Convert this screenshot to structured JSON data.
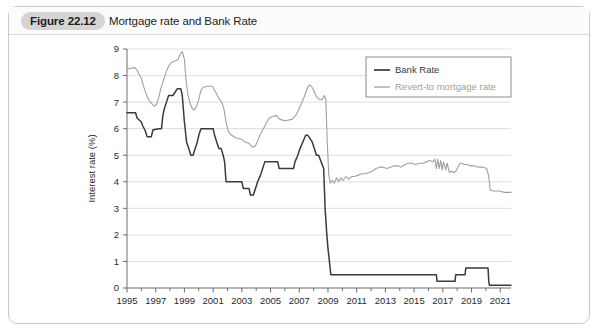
{
  "figure": {
    "badge": "Figure 22.12",
    "title": "Mortgage rate and Bank Rate"
  },
  "colors": {
    "bank_rate": "#3a3a3a",
    "revert_rate": "#a0a0a0",
    "grid": "#dedede",
    "axis": "#6d6d6d",
    "frame": "#c9c9c9",
    "badge_bg": "#d4d4d4",
    "text": "#2a2a2a"
  },
  "chart_data": {
    "type": "line",
    "title": "Mortgage rate and Bank Rate",
    "xlabel": "",
    "ylabel": "Interest rate (%)",
    "xlim": [
      1995,
      2021.75
    ],
    "ylim": [
      0,
      9
    ],
    "yticks": [
      0,
      1,
      2,
      3,
      4,
      5,
      6,
      7,
      8,
      9
    ],
    "xticks": [
      1995,
      1997,
      1999,
      2001,
      2003,
      2005,
      2007,
      2009,
      2011,
      2013,
      2015,
      2017,
      2019,
      2021
    ],
    "xtick_labels": [
      "1995",
      "1997",
      "1999",
      "2001",
      "2003",
      "2005",
      "2007",
      "2009",
      "2011",
      "2013",
      "2015",
      "2017",
      "2019",
      "2021"
    ],
    "ytick_labels": [
      "0",
      "1",
      "2",
      "3",
      "4",
      "5",
      "6",
      "7",
      "8",
      "9"
    ],
    "minor_xticks_every": 1,
    "grid": "horizontal",
    "legend_position": "top-right",
    "series": [
      {
        "name": "Bank Rate",
        "color": "#3a3a3a",
        "points": [
          [
            1995.0,
            6.6
          ],
          [
            1995.6,
            6.6
          ],
          [
            1995.7,
            6.4
          ],
          [
            1996.0,
            6.25
          ],
          [
            1996.1,
            6.1
          ],
          [
            1996.25,
            5.95
          ],
          [
            1996.4,
            5.7
          ],
          [
            1996.7,
            5.7
          ],
          [
            1996.8,
            5.95
          ],
          [
            1997.2,
            6.0
          ],
          [
            1997.4,
            6.0
          ],
          [
            1997.5,
            6.5
          ],
          [
            1997.6,
            6.75
          ],
          [
            1997.75,
            7.0
          ],
          [
            1997.9,
            7.25
          ],
          [
            1998.2,
            7.25
          ],
          [
            1998.5,
            7.5
          ],
          [
            1998.75,
            7.5
          ],
          [
            1998.85,
            7.25
          ],
          [
            1999.0,
            6.25
          ],
          [
            1999.15,
            5.5
          ],
          [
            1999.3,
            5.25
          ],
          [
            1999.45,
            5.0
          ],
          [
            1999.6,
            5.0
          ],
          [
            1999.75,
            5.25
          ],
          [
            1999.9,
            5.5
          ],
          [
            2000.0,
            5.75
          ],
          [
            2000.15,
            6.0
          ],
          [
            2000.3,
            6.0
          ],
          [
            2001.0,
            6.0
          ],
          [
            2001.1,
            5.75
          ],
          [
            2001.25,
            5.5
          ],
          [
            2001.4,
            5.25
          ],
          [
            2001.55,
            5.25
          ],
          [
            2001.7,
            5.0
          ],
          [
            2001.8,
            4.75
          ],
          [
            2001.9,
            4.0
          ],
          [
            2002.0,
            4.0
          ],
          [
            2003.0,
            4.0
          ],
          [
            2003.1,
            3.75
          ],
          [
            2003.5,
            3.75
          ],
          [
            2003.6,
            3.5
          ],
          [
            2003.8,
            3.5
          ],
          [
            2003.95,
            3.75
          ],
          [
            2004.1,
            4.0
          ],
          [
            2004.3,
            4.25
          ],
          [
            2004.45,
            4.5
          ],
          [
            2004.6,
            4.75
          ],
          [
            2004.75,
            4.75
          ],
          [
            2005.5,
            4.75
          ],
          [
            2005.6,
            4.5
          ],
          [
            2006.0,
            4.5
          ],
          [
            2006.6,
            4.5
          ],
          [
            2006.7,
            4.75
          ],
          [
            2006.9,
            5.0
          ],
          [
            2007.05,
            5.25
          ],
          [
            2007.25,
            5.5
          ],
          [
            2007.45,
            5.75
          ],
          [
            2007.6,
            5.75
          ],
          [
            2007.9,
            5.5
          ],
          [
            2008.05,
            5.25
          ],
          [
            2008.2,
            5.0
          ],
          [
            2008.35,
            5.0
          ],
          [
            2008.7,
            4.5
          ],
          [
            2008.8,
            3.0
          ],
          [
            2008.92,
            2.0
          ],
          [
            2009.0,
            1.5
          ],
          [
            2009.1,
            1.0
          ],
          [
            2009.2,
            0.5
          ],
          [
            2016.55,
            0.5
          ],
          [
            2016.6,
            0.25
          ],
          [
            2017.85,
            0.25
          ],
          [
            2017.9,
            0.5
          ],
          [
            2018.55,
            0.5
          ],
          [
            2018.6,
            0.75
          ],
          [
            2020.15,
            0.75
          ],
          [
            2020.2,
            0.25
          ],
          [
            2020.25,
            0.1
          ],
          [
            2021.75,
            0.1
          ]
        ]
      },
      {
        "name": "Revert-to mortgage rate",
        "color": "#a0a0a0",
        "points": [
          [
            1995.0,
            8.25
          ],
          [
            1995.55,
            8.3
          ],
          [
            1995.7,
            8.2
          ],
          [
            1996.0,
            7.9
          ],
          [
            1996.15,
            7.6
          ],
          [
            1996.3,
            7.35
          ],
          [
            1996.5,
            7.1
          ],
          [
            1996.7,
            6.95
          ],
          [
            1996.9,
            6.85
          ],
          [
            1997.05,
            6.9
          ],
          [
            1997.2,
            7.15
          ],
          [
            1997.35,
            7.5
          ],
          [
            1997.5,
            7.75
          ],
          [
            1997.7,
            8.1
          ],
          [
            1997.9,
            8.35
          ],
          [
            1998.1,
            8.5
          ],
          [
            1998.35,
            8.55
          ],
          [
            1998.55,
            8.6
          ],
          [
            1998.7,
            8.8
          ],
          [
            1998.85,
            8.9
          ],
          [
            1999.0,
            8.6
          ],
          [
            1999.1,
            7.9
          ],
          [
            1999.25,
            7.25
          ],
          [
            1999.4,
            6.95
          ],
          [
            1999.55,
            6.75
          ],
          [
            1999.7,
            6.7
          ],
          [
            1999.85,
            6.85
          ],
          [
            2000.0,
            7.1
          ],
          [
            2000.15,
            7.45
          ],
          [
            2000.3,
            7.55
          ],
          [
            2000.55,
            7.6
          ],
          [
            2000.95,
            7.6
          ],
          [
            2001.1,
            7.45
          ],
          [
            2001.3,
            7.25
          ],
          [
            2001.45,
            7.1
          ],
          [
            2001.6,
            7.0
          ],
          [
            2001.75,
            6.75
          ],
          [
            2001.9,
            6.25
          ],
          [
            2002.05,
            5.9
          ],
          [
            2002.3,
            5.75
          ],
          [
            2002.6,
            5.65
          ],
          [
            2003.0,
            5.6
          ],
          [
            2003.2,
            5.5
          ],
          [
            2003.5,
            5.45
          ],
          [
            2003.75,
            5.3
          ],
          [
            2003.95,
            5.35
          ],
          [
            2004.1,
            5.55
          ],
          [
            2004.3,
            5.8
          ],
          [
            2004.5,
            6.0
          ],
          [
            2004.7,
            6.2
          ],
          [
            2004.9,
            6.4
          ],
          [
            2005.1,
            6.45
          ],
          [
            2005.4,
            6.5
          ],
          [
            2005.65,
            6.35
          ],
          [
            2006.0,
            6.3
          ],
          [
            2006.5,
            6.35
          ],
          [
            2006.75,
            6.5
          ],
          [
            2006.95,
            6.7
          ],
          [
            2007.15,
            6.95
          ],
          [
            2007.35,
            7.2
          ],
          [
            2007.55,
            7.5
          ],
          [
            2007.7,
            7.65
          ],
          [
            2007.85,
            7.6
          ],
          [
            2008.0,
            7.45
          ],
          [
            2008.2,
            7.2
          ],
          [
            2008.4,
            7.1
          ],
          [
            2008.6,
            7.1
          ],
          [
            2008.75,
            7.25
          ],
          [
            2008.85,
            7.1
          ],
          [
            2008.95,
            5.5
          ],
          [
            2009.05,
            4.3
          ],
          [
            2009.15,
            3.95
          ],
          [
            2009.3,
            4.05
          ],
          [
            2009.45,
            3.95
          ],
          [
            2009.6,
            4.15
          ],
          [
            2009.75,
            4.0
          ],
          [
            2009.9,
            4.15
          ],
          [
            2010.05,
            4.05
          ],
          [
            2010.25,
            4.2
          ],
          [
            2010.45,
            4.1
          ],
          [
            2010.65,
            4.2
          ],
          [
            2010.85,
            4.2
          ],
          [
            2011.1,
            4.25
          ],
          [
            2011.35,
            4.3
          ],
          [
            2011.6,
            4.3
          ],
          [
            2011.85,
            4.35
          ],
          [
            2012.1,
            4.4
          ],
          [
            2012.35,
            4.5
          ],
          [
            2012.6,
            4.55
          ],
          [
            2012.85,
            4.55
          ],
          [
            2013.1,
            4.5
          ],
          [
            2013.35,
            4.55
          ],
          [
            2013.6,
            4.6
          ],
          [
            2013.85,
            4.6
          ],
          [
            2014.1,
            4.55
          ],
          [
            2014.35,
            4.65
          ],
          [
            2014.6,
            4.7
          ],
          [
            2014.85,
            4.7
          ],
          [
            2015.1,
            4.65
          ],
          [
            2015.35,
            4.7
          ],
          [
            2015.6,
            4.7
          ],
          [
            2015.85,
            4.75
          ],
          [
            2016.1,
            4.8
          ],
          [
            2016.3,
            4.75
          ],
          [
            2016.45,
            4.85
          ],
          [
            2016.55,
            4.5
          ],
          [
            2016.65,
            4.85
          ],
          [
            2016.75,
            4.5
          ],
          [
            2016.85,
            4.8
          ],
          [
            2016.95,
            4.45
          ],
          [
            2017.05,
            4.75
          ],
          [
            2017.2,
            4.45
          ],
          [
            2017.3,
            4.7
          ],
          [
            2017.45,
            4.35
          ],
          [
            2017.6,
            4.4
          ],
          [
            2017.75,
            4.35
          ],
          [
            2017.9,
            4.4
          ],
          [
            2018.05,
            4.55
          ],
          [
            2018.2,
            4.7
          ],
          [
            2018.35,
            4.7
          ],
          [
            2018.5,
            4.65
          ],
          [
            2018.7,
            4.65
          ],
          [
            2018.9,
            4.6
          ],
          [
            2019.2,
            4.6
          ],
          [
            2019.5,
            4.55
          ],
          [
            2019.8,
            4.55
          ],
          [
            2020.05,
            4.5
          ],
          [
            2020.2,
            4.2
          ],
          [
            2020.3,
            3.7
          ],
          [
            2020.5,
            3.65
          ],
          [
            2020.9,
            3.65
          ],
          [
            2021.3,
            3.6
          ],
          [
            2021.75,
            3.6
          ]
        ]
      }
    ]
  },
  "legend": {
    "items": [
      {
        "label": "Bank Rate",
        "color": "#3a3a3a"
      },
      {
        "label": "Revert-to mortgage rate",
        "color": "#a0a0a0"
      }
    ]
  }
}
